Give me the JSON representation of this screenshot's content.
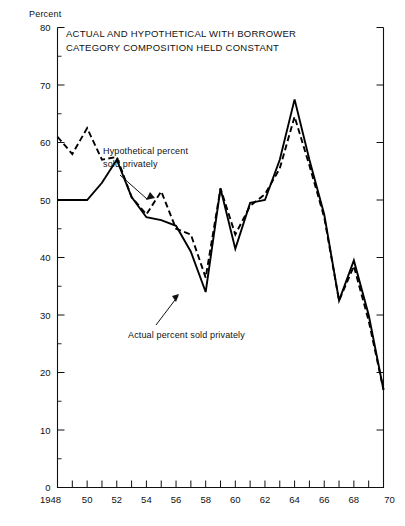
{
  "axis_unit_label": "Percent",
  "title": "ACTUAL AND HYPOTHETICAL WITH BORROWER\nCATEGORY COMPOSITION HELD CONSTANT",
  "annotations": {
    "hypothetical": "Hypothetical percent\nsold privately",
    "actual": "Actual percent sold privately"
  },
  "colors": {
    "ink": "#111111",
    "line": "#000000",
    "background": "#ffffff"
  },
  "chart_data": {
    "type": "line",
    "title": "ACTUAL AND HYPOTHETICAL WITH BORROWER CATEGORY COMPOSITION HELD CONSTANT",
    "xlabel": "",
    "ylabel": "Percent",
    "xlim": [
      1948,
      1970
    ],
    "ylim": [
      0,
      80
    ],
    "ytick_step": 10,
    "yminor_step": 5,
    "xtick_step": 1,
    "xlabel_step": 2,
    "grid": false,
    "legend_position": "inline-annotations",
    "ytick_labels": [
      "0",
      "10",
      "20",
      "30",
      "40",
      "50",
      "60",
      "70",
      "80"
    ],
    "xtick_labels": [
      "1948",
      "50",
      "52",
      "54",
      "56",
      "58",
      "60",
      "62",
      "64",
      "66",
      "68",
      "70"
    ],
    "x": [
      1948,
      1949,
      1950,
      1951,
      1952,
      1953,
      1954,
      1955,
      1956,
      1957,
      1958,
      1959,
      1960,
      1961,
      1962,
      1963,
      1964,
      1965,
      1966,
      1967,
      1968,
      1969,
      1970
    ],
    "series": [
      {
        "name": "Actual percent sold privately",
        "style": "solid",
        "values": [
          50.0,
          50.0,
          50.0,
          53.0,
          57.0,
          50.5,
          47.0,
          46.5,
          45.5,
          41.0,
          34.0,
          52.0,
          41.5,
          49.5,
          50.0,
          57.0,
          67.5,
          57.0,
          47.5,
          32.5,
          39.5,
          30.0,
          17.0
        ]
      },
      {
        "name": "Hypothetical percent sold privately",
        "style": "dashed",
        "values": [
          61.0,
          58.0,
          62.5,
          57.0,
          57.5,
          50.5,
          47.5,
          51.5,
          45.0,
          44.0,
          36.5,
          52.0,
          44.0,
          49.0,
          51.0,
          55.5,
          64.5,
          56.0,
          47.0,
          32.5,
          38.5,
          29.0,
          17.0
        ]
      }
    ]
  }
}
